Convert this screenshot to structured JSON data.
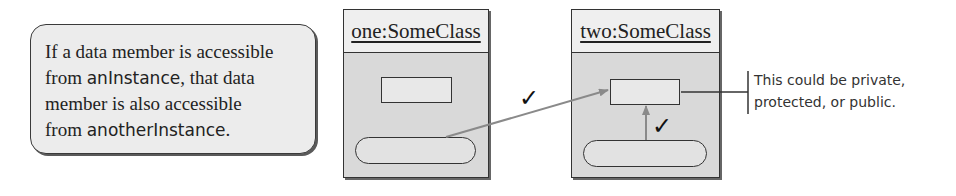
{
  "note": {
    "line1": "If a data member is accessible",
    "line2_a": "from ",
    "line2_code": "anInstance",
    "line2_b": ", that data",
    "line3": "member is also accessible",
    "line4_a": "from ",
    "line4_code": "anotherInstance",
    "line4_b": "."
  },
  "objects": [
    {
      "name": "one:SomeClass"
    },
    {
      "name": "two:SomeClass"
    }
  ],
  "callout": {
    "line1": "This could be private,",
    "line2": "protected, or public."
  },
  "marks": {
    "check1": "✓",
    "check2": "✓"
  },
  "colors": {
    "arrow": "#8a8a8a",
    "box_fill": "#d9d9d9",
    "header_fill": "#efefef",
    "border": "#333333"
  }
}
